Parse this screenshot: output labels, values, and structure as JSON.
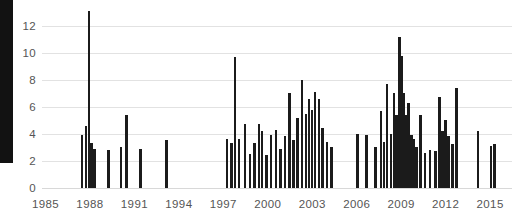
{
  "figure": {
    "name": "publications-per-period-bar-chart",
    "background_color": "#ffffff",
    "bar_color": "#1b1b1b",
    "grid_color": "#e2e2e2",
    "tick_text_color": "#555555",
    "left_black_block_color": "#121212"
  },
  "chart_data": {
    "type": "bar",
    "title": "",
    "subtitle": "",
    "xlabel": "",
    "ylabel": "",
    "xlim": [
      1984.4,
      2016.2
    ],
    "ylim": [
      0,
      13.6
    ],
    "grid": true,
    "legend": false,
    "legend_position": "none",
    "x_tick_labels": [
      "1985",
      "1988",
      "1991",
      "1994",
      "1997",
      "2000",
      "2003",
      "2006",
      "2009",
      "2012",
      "2015"
    ],
    "x_tick_values": [
      1985,
      1988,
      1991,
      1994,
      1997,
      2000,
      2003,
      2006,
      2009,
      2012,
      2015
    ],
    "y_tick_labels": [
      "0",
      "2",
      "4",
      "6",
      "8",
      "10",
      "12"
    ],
    "y_tick_values": [
      0,
      2,
      4,
      6,
      8,
      10,
      12
    ],
    "bar_width_years": 0.17,
    "series": [
      {
        "name": "count",
        "x": [
          1987.45,
          1987.72,
          1987.95,
          1988.1,
          1988.32,
          1989.25,
          1990.1,
          1990.45,
          1991.4,
          1993.15,
          1997.25,
          1997.55,
          1997.8,
          1998.05,
          1998.45,
          1998.8,
          1999.1,
          1999.4,
          1999.62,
          1999.9,
          2000.2,
          2000.55,
          2000.85,
          2001.15,
          2001.45,
          2001.72,
          2002.0,
          2002.3,
          2002.58,
          2002.78,
          2002.98,
          2003.2,
          2003.45,
          2003.7,
          2004.0,
          2004.3,
          2006.05,
          2006.65,
          2007.25,
          2007.65,
          2007.85,
          2008.05,
          2008.3,
          2008.5,
          2008.7,
          2008.9,
          2009.05,
          2009.2,
          2009.35,
          2009.5,
          2009.68,
          2009.85,
          2010.05,
          2010.3,
          2010.6,
          2010.95,
          2011.3,
          2011.6,
          2011.8,
          2012.0,
          2012.2,
          2012.45,
          2012.75,
          2014.2,
          2015.05,
          2015.28
        ],
        "values": [
          3.9,
          4.6,
          13.1,
          3.3,
          2.9,
          2.8,
          3.0,
          5.4,
          2.9,
          3.5,
          3.6,
          3.3,
          9.7,
          3.6,
          4.7,
          2.5,
          3.3,
          4.7,
          4.2,
          2.4,
          3.9,
          4.3,
          2.9,
          3.8,
          7.0,
          3.5,
          5.2,
          8.0,
          5.5,
          6.6,
          5.8,
          7.1,
          6.6,
          4.4,
          3.4,
          3.0,
          4.0,
          3.9,
          3.0,
          5.7,
          3.4,
          7.7,
          4.0,
          7.0,
          5.4,
          11.2,
          9.8,
          7.0,
          5.4,
          6.3,
          3.9,
          3.6,
          3.0,
          5.4,
          2.6,
          2.8,
          2.7,
          6.7,
          4.2,
          5.0,
          3.8,
          3.2,
          7.4,
          4.2,
          3.1,
          3.2
        ]
      }
    ]
  }
}
